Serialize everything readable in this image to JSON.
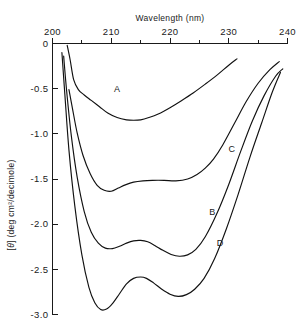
{
  "chart_data": {
    "type": "line",
    "title": "",
    "xlabel": "Wavelength (nm)",
    "ylabel": "[θ] (deg cm²/decimole)",
    "xlim": [
      200,
      240
    ],
    "ylim": [
      -3.0,
      0
    ],
    "grid": false,
    "legend_position": "inline-curve-labels",
    "x_tick_labels": [
      "200",
      "210",
      "220",
      "230",
      "240"
    ],
    "x_tick_values": [
      200,
      210,
      220,
      230,
      240
    ],
    "x_minor_tick_step": 5,
    "y_tick_labels": [
      "0",
      "-0.5",
      "-1.0",
      "-1.5",
      "-2.0",
      "-2.5",
      "-3.0"
    ],
    "y_tick_values": [
      0,
      -0.5,
      -1.0,
      -1.5,
      -2.0,
      -2.5,
      -3.0
    ],
    "y_units_note": "x 10^4",
    "series": [
      {
        "name": "A",
        "label": "A",
        "label_x": 211.0,
        "label_y": -0.5,
        "x": [
          202.5,
          203.0,
          203.6,
          204.4,
          205.4,
          206.6,
          208.0,
          209.4,
          211.0,
          212.6,
          213.8,
          215.0,
          216.4,
          218.0,
          220.0,
          222.0,
          224.0,
          226.0,
          228.0,
          230.0,
          231.4
        ],
        "y": [
          -0.02,
          -0.18,
          -0.4,
          -0.51,
          -0.57,
          -0.63,
          -0.7,
          -0.77,
          -0.82,
          -0.845,
          -0.85,
          -0.845,
          -0.82,
          -0.78,
          -0.71,
          -0.63,
          -0.545,
          -0.45,
          -0.35,
          -0.24,
          -0.17
        ]
      },
      {
        "name": "C",
        "label": "C",
        "label_x": 230.5,
        "label_y": -1.17,
        "x": [
          202.8,
          203.4,
          204.2,
          205.2,
          206.4,
          207.6,
          208.8,
          210.0,
          211.2,
          212.4,
          213.8,
          215.4,
          217.0,
          219.0,
          221.0,
          223.0,
          224.6,
          226.0,
          227.4,
          229.0,
          231.0,
          233.0,
          235.0,
          237.0,
          238.6
        ],
        "y": [
          -0.51,
          -0.72,
          -0.99,
          -1.24,
          -1.44,
          -1.57,
          -1.625,
          -1.635,
          -1.6,
          -1.565,
          -1.535,
          -1.52,
          -1.515,
          -1.515,
          -1.52,
          -1.5,
          -1.45,
          -1.38,
          -1.28,
          -1.12,
          -0.88,
          -0.64,
          -0.44,
          -0.29,
          -0.2
        ]
      },
      {
        "name": "B",
        "label": "B",
        "label_x": 227.2,
        "label_y": -1.86,
        "x": [
          201.9,
          202.4,
          203.2,
          204.2,
          205.4,
          206.6,
          207.8,
          209.0,
          210.2,
          211.4,
          212.6,
          213.8,
          215.0,
          216.2,
          217.4,
          218.8,
          220.2,
          221.6,
          223.0,
          224.4,
          226.0,
          228.0,
          230.0,
          232.0,
          234.0,
          236.0,
          238.0,
          239.2
        ],
        "y": [
          -0.14,
          -0.52,
          -1.02,
          -1.48,
          -1.86,
          -2.09,
          -2.21,
          -2.265,
          -2.27,
          -2.245,
          -2.21,
          -2.185,
          -2.18,
          -2.195,
          -2.235,
          -2.29,
          -2.335,
          -2.355,
          -2.34,
          -2.28,
          -2.14,
          -1.88,
          -1.56,
          -1.2,
          -0.86,
          -0.58,
          -0.36,
          -0.28
        ]
      },
      {
        "name": "D",
        "label": "D",
        "label_x": 228.5,
        "label_y": -2.21,
        "x": [
          201.6,
          202.1,
          202.8,
          203.8,
          205.0,
          206.2,
          207.2,
          208.2,
          209.2,
          210.2,
          211.4,
          212.6,
          213.8,
          215.0,
          216.0,
          217.2,
          218.6,
          220.0,
          221.4,
          222.8,
          224.2,
          225.8,
          227.6,
          229.6,
          231.6,
          233.6,
          235.6,
          237.4,
          238.8
        ],
        "y": [
          -0.1,
          -0.56,
          -1.18,
          -1.8,
          -2.34,
          -2.7,
          -2.87,
          -2.945,
          -2.94,
          -2.88,
          -2.77,
          -2.66,
          -2.6,
          -2.585,
          -2.6,
          -2.65,
          -2.72,
          -2.775,
          -2.8,
          -2.78,
          -2.72,
          -2.6,
          -2.38,
          -2.05,
          -1.67,
          -1.26,
          -0.88,
          -0.54,
          -0.32
        ]
      }
    ]
  },
  "axes": {
    "x_axis_title": "Wavelength (nm)",
    "y_axis_title_bracket_open": "[",
    "y_axis_title_theta": "θ",
    "y_axis_title_bracket_close": "]",
    "y_axis_title_units": "(deg cm²/decimole)"
  }
}
